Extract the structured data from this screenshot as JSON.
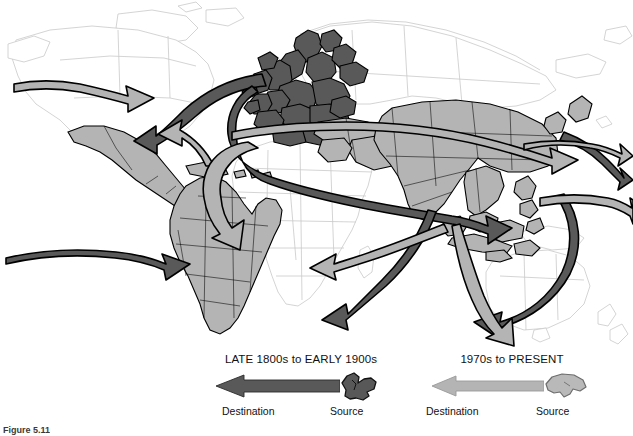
{
  "figure": {
    "caption": "Figure 5.11",
    "background_color": "#ffffff"
  },
  "map": {
    "title": "World migration flows",
    "region_shading": {
      "historical_source_color": "#595959",
      "modern_source_color": "#b4b4b4",
      "unshaded_color": "#ffffff",
      "outline_color": "#000000",
      "faint_outline_color": "#c8c8c8"
    },
    "historical_source_regions": [
      "Europe"
    ],
    "modern_source_regions": [
      "Latin America",
      "Caribbean",
      "Mexico",
      "Asia",
      "Middle East",
      "Southeast Asia"
    ],
    "unshaded_regions": [
      "North America",
      "Africa",
      "Australia",
      "New Zealand",
      "Russia",
      "Greenland"
    ],
    "flows": [
      {
        "id": "eur-to-nam",
        "era": "historical",
        "from": "Europe",
        "to": "North America"
      },
      {
        "id": "eur-to-nam-pacific",
        "era": "historical",
        "from": "Europe",
        "to": "North Pacific"
      },
      {
        "id": "eur-to-sam",
        "era": "historical",
        "from": "Europe",
        "to": "South America"
      },
      {
        "id": "eur-to-africa-asia",
        "era": "historical",
        "from": "Europe",
        "to": "South Asia"
      },
      {
        "id": "eur-to-seasia",
        "era": "historical",
        "from": "Europe",
        "to": "Southeast Asia"
      },
      {
        "id": "eur-to-australia",
        "era": "historical",
        "from": "Europe",
        "to": "Australia"
      },
      {
        "id": "asia-to-nam",
        "era": "modern",
        "from": "Asia",
        "to": "North America"
      },
      {
        "id": "latam-to-nam",
        "era": "modern",
        "from": "Latin America",
        "to": "North America"
      },
      {
        "id": "asia-to-europe",
        "era": "modern",
        "from": "Asia",
        "to": "Europe"
      },
      {
        "id": "asia-to-mideast",
        "era": "modern",
        "from": "South Asia",
        "to": "Middle East"
      },
      {
        "id": "asia-to-pacific",
        "era": "modern",
        "from": "East Asia",
        "to": "Pacific"
      },
      {
        "id": "seasia-to-pacific",
        "era": "modern",
        "from": "Southeast Asia",
        "to": "Pacific"
      }
    ]
  },
  "legend": {
    "historical": {
      "title": "LATE 1800s to EARLY 1900s",
      "destination_label": "Destination",
      "source_label": "Source",
      "arrow_color": "#595959",
      "source_icon": "europe-shape-icon"
    },
    "modern": {
      "title": "1970s to PRESENT",
      "destination_label": "Destination",
      "source_label": "Source",
      "arrow_color": "#b4b4b4",
      "source_icon": "asia-shape-icon"
    }
  }
}
